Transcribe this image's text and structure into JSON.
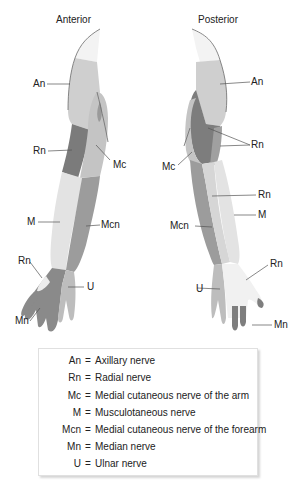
{
  "views": {
    "anterior": {
      "title": "Anterior"
    },
    "posterior": {
      "title": "Posterior"
    }
  },
  "colors": {
    "An": "#cfcfcf",
    "Rn": "#7d7d7d",
    "Mc": "#c2c2c2",
    "M": "#e2e2e2",
    "Mcn": "#9c9c9c",
    "Mn": "#8a8a8a",
    "U": "#bdbdbd",
    "shoulder_top": "#f2f2f2",
    "outline": "#6b6b6b"
  },
  "anterior_labels": [
    {
      "text": "An"
    },
    {
      "text": "Rn"
    },
    {
      "text": "Mc"
    },
    {
      "text": "M"
    },
    {
      "text": "Mcn"
    },
    {
      "text": "Rn"
    },
    {
      "text": "U"
    },
    {
      "text": "Mn"
    }
  ],
  "posterior_labels": [
    {
      "text": "An"
    },
    {
      "text": "Rn"
    },
    {
      "text": "Mc"
    },
    {
      "text": "Rn"
    },
    {
      "text": "M"
    },
    {
      "text": "Mcn"
    },
    {
      "text": "Rn"
    },
    {
      "text": "U"
    },
    {
      "text": "Mn"
    }
  ],
  "legend": [
    {
      "abbr": "An",
      "eq": "=",
      "desc": "Axillary nerve"
    },
    {
      "abbr": "Rn",
      "eq": "=",
      "desc": "Radial nerve"
    },
    {
      "abbr": "Mc",
      "eq": "=",
      "desc": "Medial cutaneous nerve of the arm"
    },
    {
      "abbr": "M",
      "eq": "=",
      "desc": "Musculotaneous nerve"
    },
    {
      "abbr": "Mcn",
      "eq": "=",
      "desc": "Medial cutaneous nerve of the forearm"
    },
    {
      "abbr": "Mn",
      "eq": "=",
      "desc": "Median nerve"
    },
    {
      "abbr": "U",
      "eq": "=",
      "desc": "Ulnar nerve"
    }
  ]
}
